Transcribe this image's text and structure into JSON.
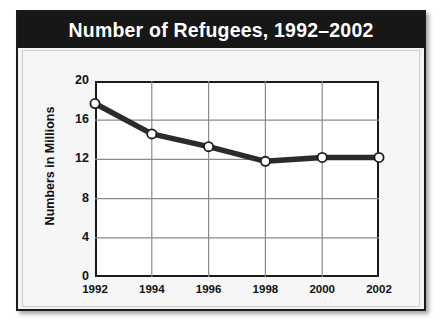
{
  "chart_data": {
    "type": "line",
    "title": "Number of Refugees, 1992–2002",
    "xlabel": "",
    "ylabel": "Numbers in Millions",
    "categories": [
      "1992",
      "1994",
      "1996",
      "1998",
      "2000",
      "2002"
    ],
    "values": [
      17.7,
      14.6,
      13.3,
      11.8,
      12.2,
      12.2
    ],
    "series": [
      {
        "name": "Number of Refugees",
        "values": [
          17.7,
          14.6,
          13.3,
          11.8,
          12.2,
          12.2
        ]
      }
    ],
    "x_tick_labels": [
      "1992",
      "1994",
      "1996",
      "1998",
      "2000",
      "2002"
    ],
    "y_tick_labels": [
      "0",
      "4",
      "8",
      "12",
      "16",
      "20"
    ],
    "y_ticks": [
      0,
      4,
      8,
      12,
      16,
      20
    ],
    "ylim": [
      0,
      20
    ],
    "grid": true,
    "legend": false,
    "legend_position": "none",
    "units": "millions",
    "colors": {
      "title_bar": "#171717",
      "title_text": "#ffffff",
      "line": "#2b2b2b",
      "marker_fill": "#ffffff",
      "marker_stroke": "#1f1f1f",
      "plot_background": "#ffffff",
      "card_background": "#f3f3f3",
      "grid": "#8a8a8a",
      "axis": "#1a1a1a"
    }
  }
}
